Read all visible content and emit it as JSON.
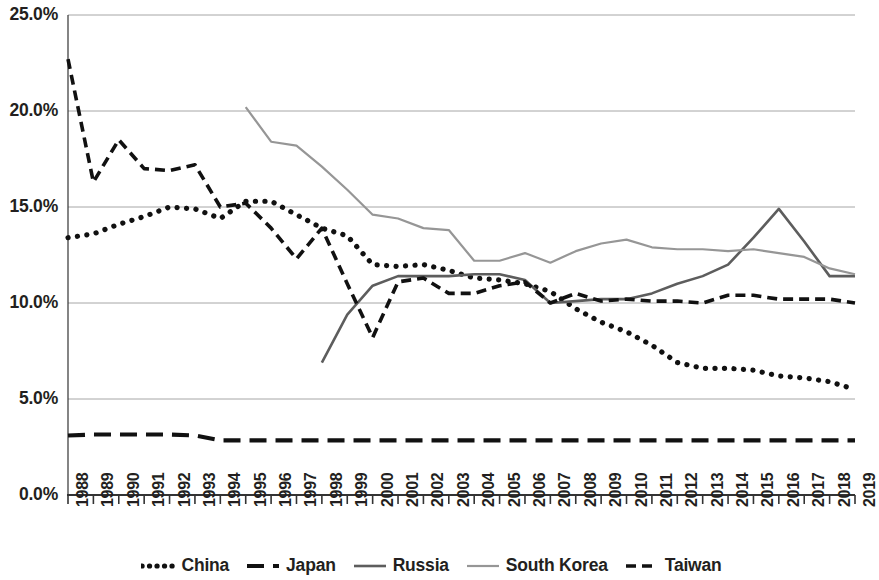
{
  "chart_data": {
    "type": "line",
    "title": "",
    "xlabel": "",
    "ylabel": "",
    "grid": true,
    "legend_position": "bottom",
    "ylim": [
      0,
      25
    ],
    "ytick_labels": [
      "25.0%",
      "20.0%",
      "15.0%",
      "10.0%",
      "5.0%",
      "0.0%"
    ],
    "ytick_values": [
      25,
      20,
      15,
      10,
      5,
      0
    ],
    "categories": [
      "1988",
      "1989",
      "1990",
      "1991",
      "1992",
      "1993",
      "1994",
      "1995",
      "1996",
      "1997",
      "1998",
      "1999",
      "2000",
      "2001",
      "2002",
      "2003",
      "2004",
      "2005",
      "2006",
      "2007",
      "2008",
      "2009",
      "2010",
      "2011",
      "2012",
      "2013",
      "2014",
      "2015",
      "2016",
      "2017",
      "2018",
      "2019"
    ],
    "x": [
      1988,
      1989,
      1990,
      1991,
      1992,
      1993,
      1994,
      1995,
      1996,
      1997,
      1998,
      1999,
      2000,
      2001,
      2002,
      2003,
      2004,
      2005,
      2006,
      2007,
      2008,
      2009,
      2010,
      2011,
      2012,
      2013,
      2014,
      2015,
      2016,
      2017,
      2018,
      2019
    ],
    "series": [
      {
        "name": "China",
        "style": "dotted",
        "color": "#111111",
        "values": [
          13.4,
          13.6,
          14.1,
          14.5,
          15.0,
          14.9,
          14.4,
          15.3,
          15.3,
          14.6,
          13.9,
          13.5,
          12.0,
          11.9,
          12.0,
          11.7,
          11.3,
          11.2,
          11.0,
          10.6,
          9.7,
          9.0,
          8.5,
          7.8,
          6.9,
          6.6,
          6.6,
          6.5,
          6.2,
          6.1,
          5.9,
          5.5
        ]
      },
      {
        "name": "Japan",
        "style": "dashed-long",
        "color": "#111111",
        "values": [
          3.1,
          3.15,
          3.15,
          3.15,
          3.15,
          3.1,
          2.85,
          2.85,
          2.85,
          2.85,
          2.85,
          2.85,
          2.85,
          2.85,
          2.85,
          2.85,
          2.85,
          2.85,
          2.85,
          2.85,
          2.85,
          2.85,
          2.85,
          2.85,
          2.85,
          2.85,
          2.85,
          2.85,
          2.85,
          2.85,
          2.85,
          2.85
        ]
      },
      {
        "name": "Russia",
        "style": "solid",
        "color": "#5d5d5d",
        "values": [
          null,
          null,
          null,
          null,
          null,
          null,
          null,
          null,
          null,
          null,
          6.9,
          9.4,
          10.9,
          11.4,
          11.4,
          11.4,
          11.5,
          11.5,
          11.2,
          10.0,
          10.1,
          10.2,
          10.2,
          10.5,
          11.0,
          11.4,
          12.0,
          13.4,
          14.9,
          13.2,
          11.4,
          11.4
        ]
      },
      {
        "name": "South Korea",
        "style": "solid-light",
        "color": "#969696",
        "values": [
          null,
          null,
          null,
          null,
          null,
          null,
          null,
          20.2,
          18.4,
          18.2,
          17.1,
          15.9,
          14.6,
          14.4,
          13.9,
          13.8,
          12.2,
          12.2,
          12.6,
          12.1,
          12.7,
          13.1,
          13.3,
          12.9,
          12.8,
          12.8,
          12.7,
          12.8,
          12.6,
          12.4,
          11.8,
          11.5
        ]
      },
      {
        "name": "Taiwan",
        "style": "dashed-short",
        "color": "#111111",
        "values": [
          22.7,
          16.3,
          18.5,
          17.0,
          16.9,
          17.2,
          15.0,
          15.2,
          13.9,
          12.3,
          13.9,
          11.0,
          8.2,
          11.1,
          11.3,
          10.5,
          10.5,
          10.9,
          11.1,
          10.0,
          10.5,
          10.1,
          10.2,
          10.1,
          10.1,
          10.0,
          10.4,
          10.4,
          10.2,
          10.2,
          10.2,
          10.0
        ]
      }
    ]
  },
  "legend": {
    "items": [
      {
        "label": "China",
        "style": "dotted",
        "color": "#111111"
      },
      {
        "label": "Japan",
        "style": "dashed-long",
        "color": "#111111"
      },
      {
        "label": "Russia",
        "style": "solid",
        "color": "#5d5d5d"
      },
      {
        "label": "South Korea",
        "style": "solid-light",
        "color": "#969696"
      },
      {
        "label": "Taiwan",
        "style": "dashed-short",
        "color": "#111111"
      }
    ]
  },
  "axes": {
    "gridline_color": "#a6a6a6",
    "axis_color": "#333333"
  }
}
